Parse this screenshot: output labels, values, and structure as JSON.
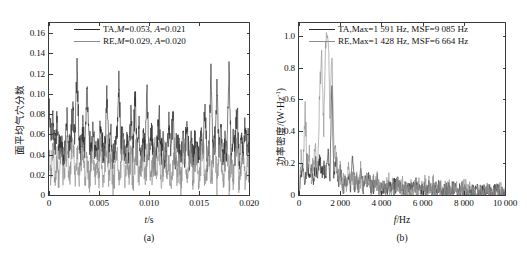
{
  "figure": {
    "background": "#ffffff",
    "colors": {
      "ta": "#2a2a2a",
      "re": "#8d8d8d",
      "axis": "#3a3a3a"
    }
  },
  "panel_a": {
    "caption": "(a)",
    "xlabel_var": "t",
    "xlabel_unit": "/s",
    "ylabel": "面平均气穴分数",
    "legend": [
      {
        "series": "TA",
        "prefix": "TA,",
        "m_sym": "M",
        "m_val": "=0.053, ",
        "a_sym": "A",
        "a_val": "=0.021",
        "color": "#2a2a2a"
      },
      {
        "series": "RE",
        "prefix": "RE,",
        "m_sym": "M",
        "m_val": "=0.029, ",
        "a_sym": "A",
        "a_val": "=0.020",
        "color": "#8d8d8d"
      }
    ],
    "xticklabels": [
      "0",
      "0.005",
      "0.010",
      "0.015",
      "0.020"
    ],
    "yticklabels": [
      "0",
      "0.02",
      "0.04",
      "0.06",
      "0.08",
      "0.10",
      "0.12",
      "0.14",
      "0.16"
    ]
  },
  "panel_b": {
    "caption": "(b)",
    "xlabel_var": "f",
    "xlabel_unit": "/Hz",
    "ylabel_main": "功率密度/(W·Hz",
    "ylabel_sup": "-1",
    "ylabel_close": ")",
    "legend": [
      {
        "series": "TA",
        "text": "TA,Max=1 591 Hz, MSF=9 085 Hz",
        "color": "#2a2a2a"
      },
      {
        "series": "RE",
        "text": "RE,Max=1 428 Hz, MSF=6 664 Hz",
        "color": "#8d8d8d"
      }
    ],
    "xticklabels": [
      "0",
      "2 000",
      "4 000",
      "6 000",
      "8 000",
      "10 000"
    ],
    "yticklabels": [
      "0",
      "0.2",
      "0.4",
      "0.6",
      "0.8",
      "1.0"
    ]
  },
  "chart_data": [
    {
      "id": "panel_a",
      "type": "line",
      "title": "",
      "xlabel": "t/s",
      "ylabel": "面平均气穴分数",
      "xlim": [
        0,
        0.02
      ],
      "ylim": [
        0,
        0.17
      ],
      "xticks": [
        0,
        0.005,
        0.01,
        0.015,
        0.02
      ],
      "yticks": [
        0,
        0.02,
        0.04,
        0.06,
        0.08,
        0.1,
        0.12,
        0.14,
        0.16
      ],
      "grid": false,
      "legend_position": "top-center",
      "annotations": [
        "TA,M=0.053, A=0.021",
        "RE,M=0.029, A=0.020"
      ],
      "series": [
        {
          "name": "TA",
          "color": "#2a2a2a",
          "mean": 0.053,
          "amplitude": 0.021,
          "x": [
            0,
            0.0002,
            0.0004,
            0.0006,
            0.0008,
            0.001,
            0.0012,
            0.0014,
            0.0016,
            0.0018,
            0.002,
            0.0022,
            0.0024,
            0.0026,
            0.0028,
            0.003,
            0.0032,
            0.0034,
            0.0036,
            0.0038,
            0.004,
            0.0042,
            0.0044,
            0.0046,
            0.0048,
            0.005,
            0.0052,
            0.0054,
            0.0056,
            0.0058,
            0.006,
            0.0062,
            0.0064,
            0.0066,
            0.0068,
            0.007,
            0.0072,
            0.0074,
            0.0076,
            0.0078,
            0.008,
            0.0082,
            0.0084,
            0.0086,
            0.0088,
            0.009,
            0.0092,
            0.0094,
            0.0096,
            0.0098,
            0.01,
            0.0102,
            0.0104,
            0.0106,
            0.0108,
            0.011,
            0.0112,
            0.0114,
            0.0116,
            0.0118,
            0.012,
            0.0122,
            0.0124,
            0.0126,
            0.0128,
            0.013,
            0.0132,
            0.0134,
            0.0136,
            0.0138,
            0.014,
            0.0142,
            0.0144,
            0.0146,
            0.0148,
            0.015,
            0.0152,
            0.0154,
            0.0156,
            0.0158,
            0.016,
            0.0162,
            0.0164,
            0.0166,
            0.0168,
            0.017,
            0.0172,
            0.0174,
            0.0176,
            0.0178,
            0.018,
            0.0182,
            0.0184,
            0.0186,
            0.0188,
            0.019,
            0.0192,
            0.0194,
            0.0196,
            0.0198,
            0.02
          ],
          "y": [
            0.082,
            0.062,
            0.079,
            0.047,
            0.068,
            0.04,
            0.055,
            0.036,
            0.048,
            0.075,
            0.041,
            0.06,
            0.086,
            0.051,
            0.128,
            0.058,
            0.044,
            0.07,
            0.039,
            0.115,
            0.052,
            0.046,
            0.063,
            0.038,
            0.057,
            0.043,
            0.072,
            0.035,
            0.051,
            0.094,
            0.042,
            0.066,
            0.037,
            0.049,
            0.058,
            0.11,
            0.045,
            0.061,
            0.033,
            0.054,
            0.04,
            0.088,
            0.036,
            0.099,
            0.047,
            0.069,
            0.034,
            0.056,
            0.043,
            0.102,
            0.038,
            0.063,
            0.044,
            0.031,
            0.052,
            0.077,
            0.039,
            0.058,
            0.035,
            0.046,
            0.067,
            0.041,
            0.085,
            0.033,
            0.054,
            0.048,
            0.036,
            0.06,
            0.042,
            0.073,
            0.032,
            0.051,
            0.038,
            0.058,
            0.045,
            0.037,
            0.064,
            0.043,
            0.092,
            0.034,
            0.049,
            0.124,
            0.039,
            0.056,
            0.106,
            0.041,
            0.068,
            0.035,
            0.051,
            0.047,
            0.131,
            0.038,
            0.06,
            0.043,
            0.086,
            0.033,
            0.055,
            0.04,
            0.072,
            0.046,
            0.053
          ]
        },
        {
          "name": "RE",
          "color": "#8d8d8d",
          "mean": 0.029,
          "amplitude": 0.02,
          "x": [
            0,
            0.0002,
            0.0004,
            0.0006,
            0.0008,
            0.001,
            0.0012,
            0.0014,
            0.0016,
            0.0018,
            0.002,
            0.0022,
            0.0024,
            0.0026,
            0.0028,
            0.003,
            0.0032,
            0.0034,
            0.0036,
            0.0038,
            0.004,
            0.0042,
            0.0044,
            0.0046,
            0.0048,
            0.005,
            0.0052,
            0.0054,
            0.0056,
            0.0058,
            0.006,
            0.0062,
            0.0064,
            0.0066,
            0.0068,
            0.007,
            0.0072,
            0.0074,
            0.0076,
            0.0078,
            0.008,
            0.0082,
            0.0084,
            0.0086,
            0.0088,
            0.009,
            0.0092,
            0.0094,
            0.0096,
            0.0098,
            0.01,
            0.0102,
            0.0104,
            0.0106,
            0.0108,
            0.011,
            0.0112,
            0.0114,
            0.0116,
            0.0118,
            0.012,
            0.0122,
            0.0124,
            0.0126,
            0.0128,
            0.013,
            0.0132,
            0.0134,
            0.0136,
            0.0138,
            0.014,
            0.0142,
            0.0144,
            0.0146,
            0.0148,
            0.015,
            0.0152,
            0.0154,
            0.0156,
            0.0158,
            0.016,
            0.0162,
            0.0164,
            0.0166,
            0.0168,
            0.017,
            0.0172,
            0.0174,
            0.0176,
            0.0178,
            0.018,
            0.0182,
            0.0184,
            0.0186,
            0.0188,
            0.019,
            0.0192,
            0.0194,
            0.0196,
            0.0198,
            0.02
          ],
          "y": [
            0.046,
            0.018,
            0.052,
            0.012,
            0.038,
            0.01,
            0.044,
            0.015,
            0.03,
            0.05,
            0.011,
            0.036,
            0.056,
            0.014,
            0.048,
            0.009,
            0.033,
            0.051,
            0.013,
            0.042,
            0.01,
            0.029,
            0.047,
            0.016,
            0.035,
            0.011,
            0.053,
            0.008,
            0.031,
            0.049,
            0.012,
            0.04,
            0.009,
            0.027,
            0.045,
            0.014,
            0.032,
            0.05,
            0.01,
            0.038,
            0.013,
            0.046,
            0.009,
            0.034,
            0.051,
            0.015,
            0.028,
            0.043,
            0.011,
            0.036,
            0.048,
            0.01,
            0.03,
            0.044,
            0.013,
            0.052,
            0.009,
            0.033,
            0.047,
            0.012,
            0.039,
            0.008,
            0.029,
            0.05,
            0.014,
            0.035,
            0.01,
            0.042,
            0.046,
            0.011,
            0.027,
            0.048,
            0.013,
            0.031,
            0.045,
            0.009,
            0.037,
            0.051,
            0.012,
            0.028,
            0.044,
            0.015,
            0.033,
            0.049,
            0.01,
            0.04,
            0.046,
            0.011,
            0.03,
            0.052,
            0.013,
            0.036,
            0.009,
            0.043,
            0.047,
            0.012,
            0.029,
            0.038,
            0.01,
            0.034,
            0.029
          ]
        }
      ]
    },
    {
      "id": "panel_b",
      "type": "line",
      "title": "",
      "xlabel": "f/Hz",
      "ylabel": "功率密度/(W·Hz-1)",
      "xlim": [
        0,
        10000
      ],
      "ylim": [
        0,
        1.08
      ],
      "xticks": [
        0,
        2000,
        4000,
        6000,
        8000,
        10000
      ],
      "yticks": [
        0,
        0.2,
        0.4,
        0.6,
        0.8,
        1.0
      ],
      "grid": false,
      "legend_position": "top-right",
      "annotations": [
        "TA,Max=1 591 Hz, MSF=9 085 Hz",
        "RE,Max=1 428 Hz, MSF=6 664 Hz"
      ],
      "series": [
        {
          "name": "TA",
          "color": "#2a2a2a",
          "max_freq_hz": 1591,
          "msf_hz": 9085,
          "x": [
            0,
            100,
            200,
            300,
            400,
            500,
            600,
            700,
            800,
            900,
            1000,
            1100,
            1200,
            1300,
            1400,
            1500,
            1591,
            1700,
            1800,
            1900,
            2000,
            2100,
            2200,
            2300,
            2400,
            2500,
            2600,
            2700,
            2800,
            2900,
            3000,
            3100,
            3200,
            3300,
            3400,
            3500,
            3600,
            3700,
            3800,
            3900,
            4000,
            4200,
            4400,
            4600,
            4800,
            5000,
            5200,
            5400,
            5600,
            5800,
            6000,
            6200,
            6400,
            6600,
            6800,
            7000,
            7200,
            7400,
            7600,
            7800,
            8000,
            8200,
            8400,
            8600,
            8800,
            9000,
            9200,
            9400,
            9600,
            9800,
            10000
          ],
          "y": [
            0.02,
            0.14,
            0.19,
            0.08,
            0.22,
            0.09,
            0.17,
            0.07,
            0.2,
            0.11,
            0.24,
            0.13,
            0.18,
            0.1,
            0.27,
            0.12,
            0.71,
            0.09,
            0.23,
            0.07,
            0.15,
            0.06,
            0.09,
            0.05,
            0.12,
            0.04,
            0.26,
            0.06,
            0.08,
            0.05,
            0.21,
            0.04,
            0.1,
            0.06,
            0.13,
            0.03,
            0.08,
            0.05,
            0.09,
            0.04,
            0.06,
            0.03,
            0.05,
            0.04,
            0.07,
            0.03,
            0.05,
            0.04,
            0.06,
            0.03,
            0.04,
            0.03,
            0.05,
            0.02,
            0.04,
            0.03,
            0.04,
            0.02,
            0.03,
            0.02,
            0.03,
            0.02,
            0.03,
            0.02,
            0.02,
            0.02,
            0.02,
            0.01,
            0.02,
            0.01,
            0.01
          ]
        },
        {
          "name": "RE",
          "color": "#8d8d8d",
          "max_freq_hz": 1428,
          "msf_hz": 6664,
          "x": [
            0,
            100,
            200,
            300,
            400,
            500,
            600,
            700,
            800,
            900,
            1000,
            1100,
            1200,
            1300,
            1428,
            1500,
            1600,
            1700,
            1800,
            1900,
            2000,
            2100,
            2200,
            2300,
            2400,
            2500,
            2600,
            2700,
            2800,
            2900,
            3000,
            3100,
            3200,
            3300,
            3400,
            3500,
            3600,
            3700,
            3800,
            3900,
            4000,
            4200,
            4400,
            4600,
            4800,
            5000,
            5200,
            5400,
            5600,
            5800,
            6000,
            6200,
            6400,
            6600,
            6800,
            7000,
            7200,
            7400,
            7600,
            7800,
            8000,
            8200,
            8400,
            8600,
            8800,
            9000,
            9200,
            9400,
            9600,
            9800,
            10000
          ],
          "y": [
            0.03,
            0.21,
            0.18,
            0.56,
            0.12,
            0.26,
            0.1,
            0.19,
            0.33,
            0.14,
            0.62,
            0.88,
            0.41,
            0.96,
            1.0,
            0.44,
            0.91,
            0.3,
            0.27,
            0.11,
            0.18,
            0.07,
            0.1,
            0.06,
            0.14,
            0.05,
            0.11,
            0.07,
            0.09,
            0.05,
            0.13,
            0.04,
            0.09,
            0.06,
            0.1,
            0.04,
            0.07,
            0.05,
            0.08,
            0.04,
            0.05,
            0.03,
            0.06,
            0.04,
            0.05,
            0.03,
            0.06,
            0.03,
            0.04,
            0.03,
            0.05,
            0.02,
            0.04,
            0.03,
            0.03,
            0.02,
            0.03,
            0.02,
            0.03,
            0.02,
            0.02,
            0.02,
            0.02,
            0.01,
            0.02,
            0.01,
            0.02,
            0.01,
            0.01,
            0.01,
            0.01
          ]
        }
      ]
    }
  ]
}
